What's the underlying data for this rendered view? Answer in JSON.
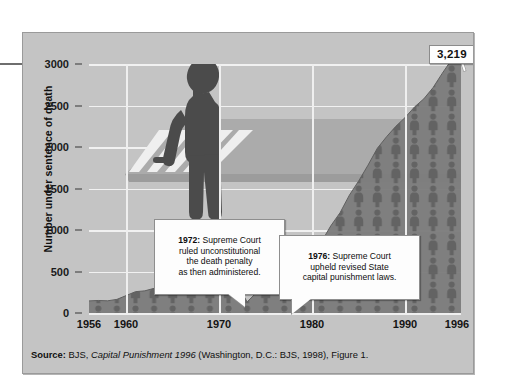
{
  "chart_data": {
    "type": "area",
    "title": "",
    "subtitle": "",
    "xlabel": "",
    "ylabel": "Number under sentence of death",
    "xlim": [
      1956,
      1996
    ],
    "ylim": [
      0,
      3200
    ],
    "yticks": [
      0,
      500,
      1000,
      1500,
      2000,
      2500,
      3000
    ],
    "ytick_labels": [
      "0",
      "500",
      "1000",
      "1500",
      "2000",
      "2500",
      "3000"
    ],
    "xticks": [
      1956,
      1960,
      1970,
      1980,
      1990,
      1996
    ],
    "xtick_labels": [
      "1956",
      "1960",
      "1970",
      "1980",
      "1990",
      "1996"
    ],
    "grid": true,
    "legend": "none",
    "series_name": "Number under sentence of death",
    "x": [
      1956,
      1957,
      1958,
      1959,
      1960,
      1961,
      1962,
      1963,
      1964,
      1965,
      1966,
      1967,
      1968,
      1969,
      1970,
      1971,
      1972,
      1973,
      1974,
      1975,
      1976,
      1977,
      1978,
      1979,
      1980,
      1981,
      1982,
      1983,
      1984,
      1985,
      1986,
      1987,
      1988,
      1989,
      1990,
      1991,
      1992,
      1993,
      1994,
      1995,
      1996
    ],
    "values": [
      146,
      151,
      147,
      164,
      210,
      257,
      267,
      297,
      315,
      331,
      406,
      435,
      517,
      575,
      631,
      642,
      334,
      134,
      244,
      488,
      420,
      423,
      482,
      593,
      691,
      860,
      1050,
      1209,
      1420,
      1591,
      1781,
      1984,
      2124,
      2250,
      2356,
      2482,
      2580,
      2716,
      2890,
      3054,
      3219
    ],
    "peak_label": "3,219",
    "peak_year": 1996,
    "annotations": [
      {
        "id": "1972",
        "bold": "1972:",
        "text": " Supreme Court\nruled unconstitutional\nthe death penalty\nas then administered.",
        "points_to_year": 1972
      },
      {
        "id": "1976",
        "bold": "1976:",
        "text": " Supreme Court\nupheld revised State\ncapital punishment laws.",
        "points_to_year": 1976
      }
    ],
    "colors": {
      "panel_background": "#c4c4c4",
      "area_fill": "#7b7b7b",
      "pictogram": "#5d5d5d",
      "gridline": "#f1f1f1",
      "road": "#adadad",
      "figure_silhouette": "#4a4a4a",
      "callout_background": "#fdfdfd"
    }
  },
  "source": {
    "label": "Source:",
    "agency": " BJS, ",
    "publication": "Capital Punishment 1996",
    "rest": " (Washington, D.C.: BJS, 1998), Figure 1."
  }
}
